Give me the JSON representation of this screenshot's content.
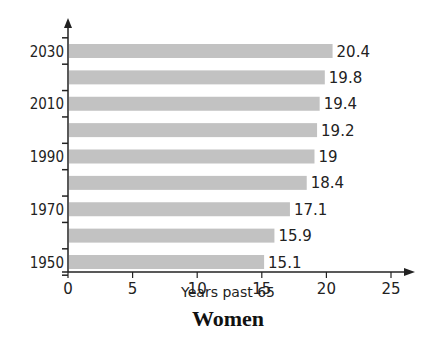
{
  "chart_data": {
    "type": "bar",
    "orientation": "horizontal",
    "title": "Women",
    "xlabel": "Years past 65",
    "ylabel": "",
    "categories": [
      "1950",
      "1960",
      "1970",
      "1980",
      "1990",
      "2000",
      "2010",
      "2020",
      "2030"
    ],
    "y_tick_labels": [
      "1950",
      "1970",
      "1990",
      "2010",
      "2030"
    ],
    "values": [
      15.1,
      15.9,
      17.1,
      18.4,
      19,
      19.2,
      19.4,
      19.8,
      20.4
    ],
    "value_labels": [
      "15.1",
      "15.9",
      "17.1",
      "18.4",
      "19",
      "19.2",
      "19.4",
      "19.8",
      "20.4"
    ],
    "x_ticks": [
      0,
      5,
      10,
      15,
      20,
      25
    ],
    "xlim": [
      0,
      25
    ],
    "grid": false,
    "legend": null,
    "bar_color": "#c2c2c2"
  }
}
